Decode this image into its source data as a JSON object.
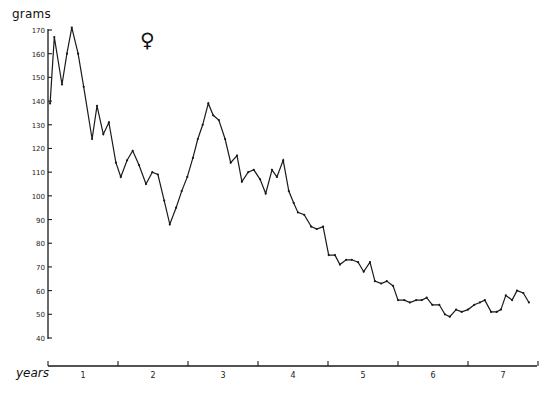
{
  "chart_data": {
    "type": "line",
    "title": "",
    "annotation": "♀",
    "xlabel": "years",
    "ylabel": "grams",
    "xlim": [
      0,
      7.0
    ],
    "ylim": [
      40,
      170
    ],
    "grid": false,
    "legend": null,
    "x_ticks": [
      0,
      1,
      2,
      3,
      4,
      5,
      6,
      7
    ],
    "x_tick_labels": [
      "1",
      "2",
      "3",
      "4",
      "5",
      "6",
      "7"
    ],
    "x_tick_label_positions": [
      0.5,
      1.5,
      2.5,
      3.5,
      4.5,
      5.5,
      6.5
    ],
    "y_ticks": [
      40,
      50,
      60,
      70,
      80,
      90,
      100,
      110,
      120,
      130,
      140,
      150,
      160,
      170
    ],
    "y_tick_labels": [
      "40",
      "50",
      "60",
      "70",
      "80",
      "90",
      "100",
      "110",
      "120",
      "130",
      "140",
      "150",
      "160",
      "170"
    ],
    "series": [
      {
        "name": "female weight",
        "x": [
          0.03,
          0.09,
          0.2,
          0.27,
          0.34,
          0.43,
          0.51,
          0.63,
          0.7,
          0.79,
          0.87,
          0.97,
          1.04,
          1.13,
          1.21,
          1.3,
          1.4,
          1.49,
          1.57,
          1.66,
          1.74,
          1.83,
          1.91,
          1.99,
          2.07,
          2.14,
          2.21,
          2.29,
          2.36,
          2.44,
          2.53,
          2.61,
          2.7,
          2.77,
          2.86,
          2.94,
          3.03,
          3.11,
          3.2,
          3.27,
          3.36,
          3.44,
          3.51,
          3.57,
          3.66,
          3.76,
          3.84,
          3.93,
          4.01,
          4.1,
          4.17,
          4.26,
          4.34,
          4.43,
          4.51,
          4.6,
          4.67,
          4.76,
          4.84,
          4.93,
          5.0,
          5.09,
          5.17,
          5.26,
          5.34,
          5.41,
          5.49,
          5.59,
          5.67,
          5.74,
          5.83,
          5.91,
          6.0,
          6.09,
          6.17,
          6.24,
          6.33,
          6.41,
          6.47,
          6.54,
          6.63,
          6.7,
          6.79,
          6.87
        ],
        "values": [
          139,
          167,
          147,
          160,
          171,
          160,
          146,
          124,
          138,
          126,
          131,
          114,
          108,
          115,
          119,
          113,
          105,
          110,
          109,
          98,
          88,
          95,
          102,
          108,
          116,
          124,
          130,
          139,
          134,
          132,
          124,
          114,
          117,
          106,
          110,
          111,
          107,
          101,
          111,
          108,
          115,
          102,
          97,
          93,
          92,
          87,
          86,
          87,
          75,
          75,
          71,
          73,
          73,
          72,
          68,
          72,
          64,
          63,
          64,
          62,
          56,
          56,
          55,
          56,
          56,
          57,
          54,
          54,
          50,
          49,
          52,
          51,
          52,
          54,
          55,
          56,
          51,
          51,
          52,
          58,
          56,
          60,
          59,
          55
        ]
      }
    ]
  },
  "plot_area": {
    "x0_px": 48,
    "year_px": 70,
    "y_axis_top_px": 30,
    "y_axis_bottom_px": 338,
    "x_axis_y_px": 366,
    "x_axis_end_px": 537
  }
}
